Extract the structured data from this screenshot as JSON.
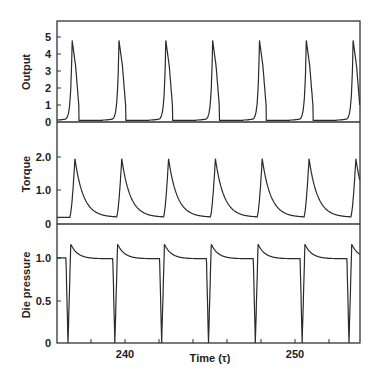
{
  "chart_data": [
    {
      "type": "line",
      "panel": "top",
      "ylabel": "Output",
      "ylim": [
        0,
        5.5
      ],
      "yticks": [
        0,
        1,
        2,
        3,
        4,
        5
      ],
      "ytick_labels": [
        "0",
        "1",
        "2",
        "3",
        "4",
        "5"
      ],
      "series": [
        {
          "name": "Output",
          "description": "sharp periodic spikes to ~4.8, baseline ~0.1, period ~3.4 τ",
          "peaks_x": [
            235.3,
            238.7,
            242.1,
            245.5,
            248.9,
            252.3,
            255.7
          ],
          "peak_value": 4.8,
          "baseline": 0.1
        }
      ]
    },
    {
      "type": "line",
      "panel": "middle",
      "ylabel": "Torque",
      "ylim": [
        0,
        2.5
      ],
      "yticks": [
        0,
        1.0,
        2.0
      ],
      "ytick_labels": [
        "0",
        "1.0",
        "2.0"
      ],
      "series": [
        {
          "name": "Torque",
          "description": "periodic peaks ~1.95 with slow decay to ~0.2",
          "peaks_x": [
            235.5,
            238.9,
            242.3,
            245.7,
            249.1,
            252.5,
            255.9
          ],
          "peak_value": 1.95,
          "minimum": 0.2
        }
      ]
    },
    {
      "type": "line",
      "panel": "bottom",
      "ylabel": "Die pressure",
      "ylim": [
        0,
        1.4
      ],
      "yticks": [
        0,
        0.5,
        1.0
      ],
      "ytick_labels": [
        "0",
        "0.5",
        "1.0"
      ],
      "series": [
        {
          "name": "Die pressure",
          "description": "plateau ~1.05 with drops to 0 and overshoot to ~1.22",
          "drops_x": [
            235.0,
            238.4,
            241.8,
            245.2,
            248.6,
            252.0,
            255.4
          ],
          "plateau": 1.05,
          "overshoot": 1.22,
          "minimum": 0
        }
      ]
    }
  ],
  "xaxis": {
    "label": "Time (τ)",
    "xlim": [
      234.2,
      256.2
    ],
    "ticks_labeled": [
      240,
      250
    ],
    "tick_labels": [
      "240",
      "250"
    ],
    "minor_ticks": [
      236,
      238,
      242,
      244,
      246,
      248,
      252,
      254
    ]
  },
  "labels": {
    "output": "Output",
    "torque": "Torque",
    "die_pressure": "Die pressure",
    "time": "Time (τ)",
    "x240": "240",
    "x250": "250",
    "o0": "0",
    "o1": "1",
    "o2": "2",
    "o3": "3",
    "o4": "4",
    "o5": "5",
    "t0": "0",
    "t1": "1.0",
    "t2": "2.0",
    "p0": "0",
    "p05": "0.5",
    "p1": "1.0"
  },
  "colors": {
    "line": "#2a2a2a",
    "frame": "#333333",
    "background": "#ffffff"
  }
}
